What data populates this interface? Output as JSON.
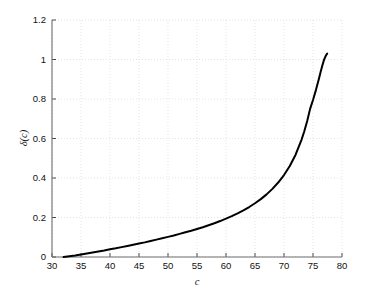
{
  "chart_data": {
    "type": "line",
    "title": "",
    "xlabel": "c",
    "ylabel": "δ(c)",
    "xlim": [
      30,
      80
    ],
    "ylim": [
      0,
      1.2
    ],
    "xticks": [
      30,
      35,
      40,
      45,
      50,
      55,
      60,
      65,
      70,
      75,
      80
    ],
    "xtick_labels": [
      "30",
      "35",
      "40",
      "45",
      "50",
      "55",
      "60",
      "65",
      "70",
      "75",
      "80"
    ],
    "yticks": [
      0,
      0.2,
      0.4,
      0.6,
      0.8,
      1,
      1.2
    ],
    "ytick_labels": [
      "0",
      "0.2",
      "0.4",
      "0.6",
      "0.8",
      "1",
      "1.2"
    ],
    "grid": true,
    "grid_style": "dotted",
    "grid_color": "#d9d9d9",
    "legend": null,
    "series": [
      {
        "name": "δ(c)",
        "color": "#000000",
        "line_width": 2.0,
        "x": [
          32.0,
          33.0,
          34.0,
          35.0,
          36.0,
          37.0,
          38.0,
          39.0,
          40.0,
          41.0,
          42.0,
          43.0,
          44.0,
          45.0,
          46.0,
          47.0,
          48.0,
          49.0,
          50.0,
          51.0,
          52.0,
          53.0,
          54.0,
          55.0,
          56.0,
          57.0,
          58.0,
          59.0,
          60.0,
          61.0,
          62.0,
          63.0,
          64.0,
          65.0,
          66.0,
          67.0,
          68.0,
          69.0,
          70.0,
          71.0,
          72.0,
          73.0,
          73.5,
          74.0,
          74.5,
          75.0,
          75.5,
          76.0,
          76.3,
          76.6,
          76.9,
          77.1,
          77.3,
          77.45
        ],
        "y": [
          0.0,
          0.004,
          0.008,
          0.013,
          0.018,
          0.023,
          0.028,
          0.033,
          0.039,
          0.044,
          0.05,
          0.056,
          0.062,
          0.068,
          0.074,
          0.081,
          0.088,
          0.095,
          0.102,
          0.109,
          0.117,
          0.125,
          0.133,
          0.142,
          0.151,
          0.161,
          0.171,
          0.182,
          0.194,
          0.207,
          0.221,
          0.236,
          0.253,
          0.272,
          0.293,
          0.317,
          0.345,
          0.377,
          0.415,
          0.461,
          0.518,
          0.592,
          0.637,
          0.689,
          0.75,
          0.795,
          0.845,
          0.9,
          0.935,
          0.968,
          0.998,
          1.012,
          1.024,
          1.03
        ]
      }
    ],
    "annotations": []
  },
  "axes": {
    "x_axis_name": "c-axis",
    "y_axis_name": "delta-axis"
  }
}
